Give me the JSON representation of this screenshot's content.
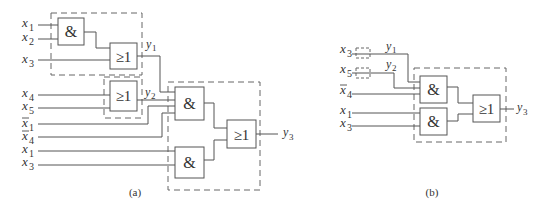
{
  "diagram_a": {
    "caption": "(a)",
    "inputs": [
      {
        "var": "x",
        "sub": "1",
        "bar": false
      },
      {
        "var": "x",
        "sub": "2",
        "bar": false
      },
      {
        "var": "x",
        "sub": "3",
        "bar": false
      },
      {
        "var": "x",
        "sub": "4",
        "bar": false
      },
      {
        "var": "x",
        "sub": "5",
        "bar": false
      },
      {
        "var": "x",
        "sub": "1",
        "bar": true
      },
      {
        "var": "x",
        "sub": "4",
        "bar": true
      },
      {
        "var": "x",
        "sub": "1",
        "bar": false
      },
      {
        "var": "x",
        "sub": "3",
        "bar": false
      }
    ],
    "gates": {
      "and1": "&",
      "or1": "≥1",
      "or2": "≥1",
      "and2": "&",
      "and3": "&",
      "or3": "≥1"
    },
    "outputs": {
      "y1": {
        "var": "y",
        "sub": "1"
      },
      "y2": {
        "var": "y",
        "sub": "2"
      },
      "y3": {
        "var": "y",
        "sub": "3"
      }
    }
  },
  "diagram_b": {
    "caption": "(b)",
    "inputs": [
      {
        "var": "x",
        "sub": "3",
        "bar": false
      },
      {
        "var": "x",
        "sub": "5",
        "bar": false
      },
      {
        "var": "x",
        "sub": "4",
        "bar": true
      },
      {
        "var": "x",
        "sub": "1",
        "bar": false
      },
      {
        "var": "x",
        "sub": "3",
        "bar": false
      }
    ],
    "gates": {
      "and1": "&",
      "and2": "&",
      "or1": "≥1"
    },
    "outputs": {
      "y1": {
        "var": "y",
        "sub": "1"
      },
      "y2": {
        "var": "y",
        "sub": "2"
      },
      "y3": {
        "var": "y",
        "sub": "3"
      }
    }
  }
}
